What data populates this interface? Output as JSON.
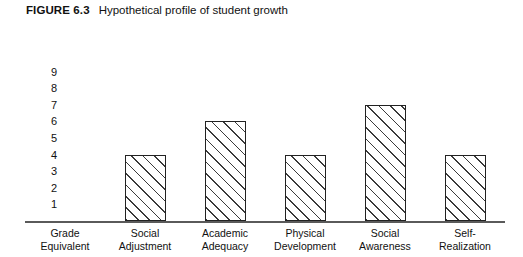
{
  "caption": {
    "figure_label": "FIGURE 6.3",
    "title": "Hypothetical profile of student growth"
  },
  "chart_data": {
    "type": "bar",
    "title": "Hypothetical profile of student growth",
    "xlabel": "",
    "ylabel": "",
    "grid": false,
    "legend": null,
    "ylim": [
      0,
      9
    ],
    "y_ticks": [
      1,
      2,
      3,
      4,
      5,
      6,
      7,
      8,
      9
    ],
    "categories": [
      "Grade\nEquivalent",
      "Social\nAdjustment",
      "Academic\nAdequacy",
      "Physical\nDevelopment",
      "Social\nAwareness",
      "Self-\nRealization"
    ],
    "values": [
      null,
      4,
      6,
      4,
      7,
      4
    ],
    "bar_style": {
      "fill": "#ffffff",
      "outline": "#222222",
      "hatch": "diagonal-45-up"
    }
  }
}
